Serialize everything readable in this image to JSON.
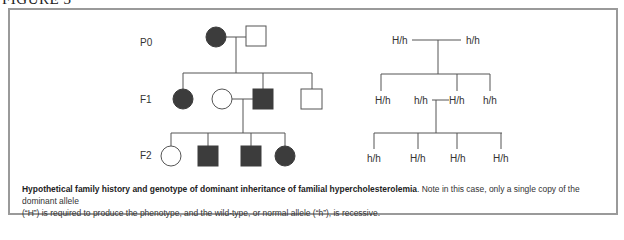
{
  "figure": {
    "title": "FIGURE 3"
  },
  "pedigree": {
    "generations": [
      "P0",
      "F1",
      "F2"
    ],
    "legend_colors": {
      "affected": "#3c3c3c",
      "unaffected": "#ffffff",
      "line": "#555555"
    },
    "P0": [
      {
        "sex": "female",
        "affected": true
      },
      {
        "sex": "male",
        "affected": false
      }
    ],
    "F1": [
      {
        "sex": "female",
        "affected": true
      },
      {
        "sex": "female",
        "affected": false
      },
      {
        "sex": "male",
        "affected": true
      },
      {
        "sex": "male",
        "affected": false
      }
    ],
    "F2": [
      {
        "sex": "female",
        "affected": false
      },
      {
        "sex": "male",
        "affected": true
      },
      {
        "sex": "male",
        "affected": true
      },
      {
        "sex": "female",
        "affected": true
      }
    ]
  },
  "genotypes": {
    "P0": [
      "H/h",
      "h/h"
    ],
    "F1": [
      "H/h",
      "h/h",
      "H/h",
      "h/h"
    ],
    "F2": [
      "h/h",
      "H/h",
      "H/h",
      "H/h"
    ]
  },
  "caption": {
    "bold": "Hypothetical family history and genotype of dominant inheritance of familial hypercholesterolemia",
    "line1_rest": ". Note in this case, only a single copy of the dominant allele",
    "line2": "(“H”) is required to produce the phenotype, and the wild-type, or normal allele (“h”), is recessive."
  }
}
